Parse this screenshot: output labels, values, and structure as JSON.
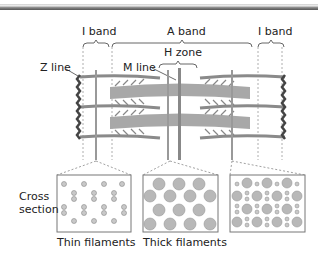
{
  "labels": {
    "i_band_left": "I band",
    "a_band": "A band",
    "i_band_right": "I band",
    "h_zone": "H zone",
    "z_line": "Z line",
    "m_line": "M line",
    "cross_section": [
      "Cross",
      "section"
    ],
    "thin_filaments": "Thin filaments",
    "thick_filaments": "Thick filaments"
  },
  "colors": {
    "filament": "#9a9a9a",
    "z_line": "#444444",
    "dot_fill": "#bdbdbd",
    "outline": "#777777"
  }
}
